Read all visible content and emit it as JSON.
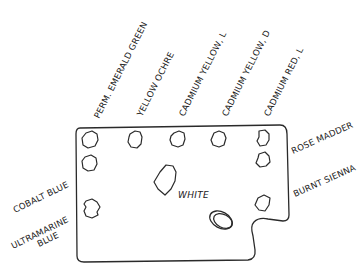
{
  "diagram": {
    "title": "",
    "labels": {
      "perm_emerald_green": "PERM. EMERALD GREEN",
      "yellow_ochre": "YELLOW OCHRE",
      "cadmium_yellow_l": "CADMIUM YELLOW, L",
      "cadmium_yellow_d": "CADMIUM YELLOW, D",
      "cadmium_red_l": "CADMIUM RED, L",
      "rose_madder": "ROSE MADDER",
      "burnt_sienna": "BURNT SIENNA",
      "cobalt_blue": "COBALT BLUE",
      "ultramarine_line1": "ULTRAMARINE",
      "ultramarine_line2": "BLUE",
      "white": "WHITE"
    },
    "paint_wells": [
      {
        "id": "perm-emerald-green",
        "position": "top row, 1st"
      },
      {
        "id": "yellow-ochre",
        "position": "top row, 2nd"
      },
      {
        "id": "cadmium-yellow-l",
        "position": "top row, 3rd"
      },
      {
        "id": "cadmium-yellow-d",
        "position": "top row, 4th"
      },
      {
        "id": "cadmium-red-l",
        "position": "top row, 5th"
      },
      {
        "id": "rose-madder",
        "position": "right column, 2nd"
      },
      {
        "id": "burnt-sienna",
        "position": "right column, 3rd"
      },
      {
        "id": "cobalt-blue",
        "position": "left column, 2nd"
      },
      {
        "id": "ultramarine-blue",
        "position": "left column, 3rd"
      },
      {
        "id": "white",
        "position": "center"
      }
    ],
    "thumb_hole": "oval near lower-right",
    "colors": {
      "line": "#2a2a2a",
      "background": "#ffffff"
    }
  }
}
